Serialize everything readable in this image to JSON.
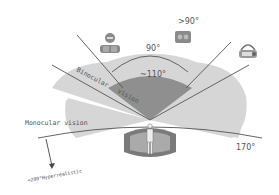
{
  "diagram": {
    "labels": {
      "binocular_1": "Binocular",
      "binocular_2": "vision",
      "monocular": "Monocular vision",
      "angle_90": "90°",
      "angle_gt90": ">90°",
      "angle_110": "~110°",
      "angle_170": "170°",
      "hyper": "<200°Hyperrealistic"
    },
    "icons": {
      "headset_left": "vr-headset-icon",
      "cardboard": "cardboard-viewer-icon",
      "helmet_right": "hmd-helmet-icon",
      "cave": "cave-immersive-display-icon",
      "person": "person-icon"
    },
    "colors": {
      "binocular_region": "#8f8f8f",
      "monocular_region": "#d4d4d4",
      "lines": "#555555",
      "text": "#555555"
    }
  }
}
